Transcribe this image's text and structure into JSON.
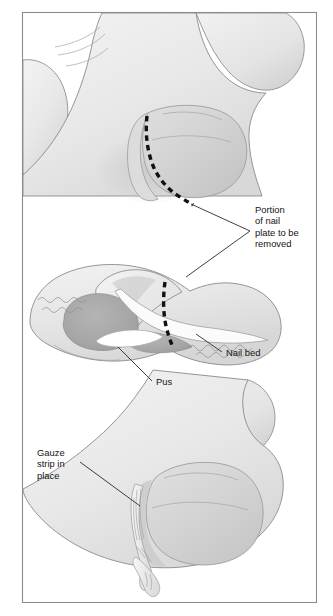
{
  "figure": {
    "background_color": "#ffffff",
    "frame_color": "#8d8d8d",
    "panel_count": 3
  },
  "labels": [
    {
      "id": "portion-of-nail-plate",
      "lines": [
        "Portion",
        "of nail",
        "plate to be",
        "removed"
      ],
      "x": 255,
      "y": 213,
      "color": "#141414"
    },
    {
      "id": "nail-bed",
      "lines": [
        "Nail bed"
      ],
      "x": 226,
      "y": 356,
      "color": "#141414"
    },
    {
      "id": "pus",
      "lines": [
        "Pus"
      ],
      "x": 156,
      "y": 385,
      "color": "#141414"
    },
    {
      "id": "gauze-strip",
      "lines": [
        "Gauze",
        "strip in",
        "place"
      ],
      "x": 37,
      "y": 456,
      "color": "#141414"
    }
  ],
  "panels": [
    {
      "id": "panel-top",
      "name": "dorsal-view-incision-marking",
      "description": "Toe viewed from above with dashed line marking portion of nail plate to be removed"
    },
    {
      "id": "panel-middle",
      "name": "sagittal-cross-section",
      "description": "Cross-section through the toe showing pus collection beneath the nail fold, the nail plate and nail bed, with dashed cut line"
    },
    {
      "id": "panel-bottom",
      "name": "gauze-packing-view",
      "description": "Toe after nail plate removal with a gauze strip packed in place along the nail groove"
    }
  ],
  "colors": {
    "skin_light": "#ededed",
    "skin_mid": "#e2e2e2",
    "skin_shadow": "#d2d2d2",
    "nail_plate": "#d6d6d6",
    "nail_plate_dark": "#c4c4c4",
    "pus": "#a9a9a9",
    "outline": "#8a8a8a",
    "dash_black": "#111111",
    "gauze": "#efefef"
  }
}
